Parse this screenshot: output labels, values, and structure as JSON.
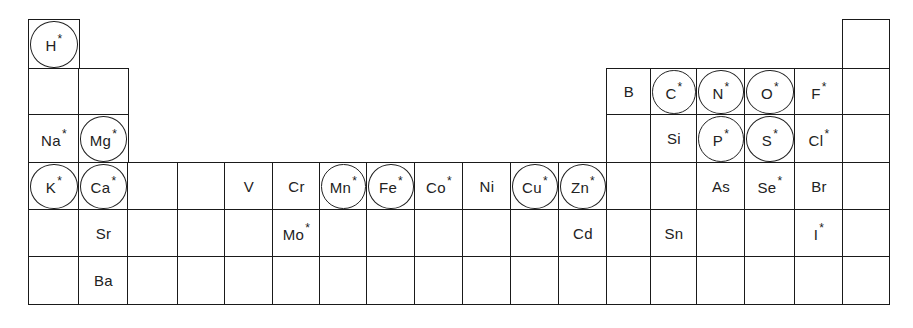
{
  "diagram": {
    "legend": {
      "asterisk": "*",
      "circle": "circled"
    },
    "grid": {
      "columns_x": [
        29,
        79,
        128,
        178,
        225,
        273,
        320,
        367,
        415,
        463,
        511,
        559,
        607,
        651,
        697,
        745,
        795,
        843,
        889
      ],
      "rows_y": [
        20,
        69,
        115,
        163,
        210,
        257,
        304
      ]
    },
    "cells": [
      {
        "row": 0,
        "col": 0,
        "symbol": "H",
        "star": true,
        "circled": true
      },
      {
        "row": 0,
        "col": 17,
        "symbol": "",
        "star": false,
        "circled": false
      },
      {
        "row": 1,
        "col": 0,
        "symbol": "",
        "star": false,
        "circled": false
      },
      {
        "row": 1,
        "col": 1,
        "symbol": "",
        "star": false,
        "circled": false
      },
      {
        "row": 1,
        "col": 12,
        "symbol": "B",
        "star": false,
        "circled": false
      },
      {
        "row": 1,
        "col": 13,
        "symbol": "C",
        "star": true,
        "circled": true
      },
      {
        "row": 1,
        "col": 14,
        "symbol": "N",
        "star": true,
        "circled": true
      },
      {
        "row": 1,
        "col": 15,
        "symbol": "O",
        "star": true,
        "circled": true
      },
      {
        "row": 1,
        "col": 16,
        "symbol": "F",
        "star": true,
        "circled": false
      },
      {
        "row": 1,
        "col": 17,
        "symbol": "",
        "star": false,
        "circled": false
      },
      {
        "row": 2,
        "col": 0,
        "symbol": "Na",
        "star": true,
        "circled": false
      },
      {
        "row": 2,
        "col": 1,
        "symbol": "Mg",
        "star": true,
        "circled": true
      },
      {
        "row": 2,
        "col": 12,
        "symbol": "",
        "star": false,
        "circled": false
      },
      {
        "row": 2,
        "col": 13,
        "symbol": "Si",
        "star": false,
        "circled": false
      },
      {
        "row": 2,
        "col": 14,
        "symbol": "P",
        "star": true,
        "circled": true
      },
      {
        "row": 2,
        "col": 15,
        "symbol": "S",
        "star": true,
        "circled": true
      },
      {
        "row": 2,
        "col": 16,
        "symbol": "Cl",
        "star": true,
        "circled": false
      },
      {
        "row": 2,
        "col": 17,
        "symbol": "",
        "star": false,
        "circled": false
      },
      {
        "row": 3,
        "col": 0,
        "symbol": "K",
        "star": true,
        "circled": true
      },
      {
        "row": 3,
        "col": 1,
        "symbol": "Ca",
        "star": true,
        "circled": true
      },
      {
        "row": 3,
        "col": 2,
        "symbol": "",
        "star": false,
        "circled": false
      },
      {
        "row": 3,
        "col": 3,
        "symbol": "",
        "star": false,
        "circled": false
      },
      {
        "row": 3,
        "col": 4,
        "symbol": "V",
        "star": false,
        "circled": false
      },
      {
        "row": 3,
        "col": 5,
        "symbol": "Cr",
        "star": false,
        "circled": false
      },
      {
        "row": 3,
        "col": 6,
        "symbol": "Mn",
        "star": true,
        "circled": true
      },
      {
        "row": 3,
        "col": 7,
        "symbol": "Fe",
        "star": true,
        "circled": true
      },
      {
        "row": 3,
        "col": 8,
        "symbol": "Co",
        "star": true,
        "circled": false
      },
      {
        "row": 3,
        "col": 9,
        "symbol": "Ni",
        "star": false,
        "circled": false
      },
      {
        "row": 3,
        "col": 10,
        "symbol": "Cu",
        "star": true,
        "circled": true
      },
      {
        "row": 3,
        "col": 11,
        "symbol": "Zn",
        "star": true,
        "circled": true
      },
      {
        "row": 3,
        "col": 12,
        "symbol": "",
        "star": false,
        "circled": false
      },
      {
        "row": 3,
        "col": 13,
        "symbol": "",
        "star": false,
        "circled": false
      },
      {
        "row": 3,
        "col": 14,
        "symbol": "As",
        "star": false,
        "circled": false
      },
      {
        "row": 3,
        "col": 15,
        "symbol": "Se",
        "star": true,
        "circled": false
      },
      {
        "row": 3,
        "col": 16,
        "symbol": "Br",
        "star": false,
        "circled": false
      },
      {
        "row": 3,
        "col": 17,
        "symbol": "",
        "star": false,
        "circled": false
      },
      {
        "row": 4,
        "col": 0,
        "symbol": "",
        "star": false,
        "circled": false
      },
      {
        "row": 4,
        "col": 1,
        "symbol": "Sr",
        "star": false,
        "circled": false
      },
      {
        "row": 4,
        "col": 2,
        "symbol": "",
        "star": false,
        "circled": false
      },
      {
        "row": 4,
        "col": 3,
        "symbol": "",
        "star": false,
        "circled": false
      },
      {
        "row": 4,
        "col": 4,
        "symbol": "",
        "star": false,
        "circled": false
      },
      {
        "row": 4,
        "col": 5,
        "symbol": "Mo",
        "star": true,
        "circled": false
      },
      {
        "row": 4,
        "col": 6,
        "symbol": "",
        "star": false,
        "circled": false
      },
      {
        "row": 4,
        "col": 7,
        "symbol": "",
        "star": false,
        "circled": false
      },
      {
        "row": 4,
        "col": 8,
        "symbol": "",
        "star": false,
        "circled": false
      },
      {
        "row": 4,
        "col": 9,
        "symbol": "",
        "star": false,
        "circled": false
      },
      {
        "row": 4,
        "col": 10,
        "symbol": "",
        "star": false,
        "circled": false
      },
      {
        "row": 4,
        "col": 11,
        "symbol": "Cd",
        "star": false,
        "circled": false
      },
      {
        "row": 4,
        "col": 12,
        "symbol": "",
        "star": false,
        "circled": false
      },
      {
        "row": 4,
        "col": 13,
        "symbol": "Sn",
        "star": false,
        "circled": false
      },
      {
        "row": 4,
        "col": 14,
        "symbol": "",
        "star": false,
        "circled": false
      },
      {
        "row": 4,
        "col": 15,
        "symbol": "",
        "star": false,
        "circled": false
      },
      {
        "row": 4,
        "col": 16,
        "symbol": "I",
        "star": true,
        "circled": false
      },
      {
        "row": 4,
        "col": 17,
        "symbol": "",
        "star": false,
        "circled": false
      },
      {
        "row": 5,
        "col": 0,
        "symbol": "",
        "star": false,
        "circled": false
      },
      {
        "row": 5,
        "col": 1,
        "symbol": "Ba",
        "star": false,
        "circled": false
      },
      {
        "row": 5,
        "col": 2,
        "symbol": "",
        "star": false,
        "circled": false
      },
      {
        "row": 5,
        "col": 3,
        "symbol": "",
        "star": false,
        "circled": false
      },
      {
        "row": 5,
        "col": 4,
        "symbol": "",
        "star": false,
        "circled": false
      },
      {
        "row": 5,
        "col": 5,
        "symbol": "",
        "star": false,
        "circled": false
      },
      {
        "row": 5,
        "col": 6,
        "symbol": "",
        "star": false,
        "circled": false
      },
      {
        "row": 5,
        "col": 7,
        "symbol": "",
        "star": false,
        "circled": false
      },
      {
        "row": 5,
        "col": 8,
        "symbol": "",
        "star": false,
        "circled": false
      },
      {
        "row": 5,
        "col": 9,
        "symbol": "",
        "star": false,
        "circled": false
      },
      {
        "row": 5,
        "col": 10,
        "symbol": "",
        "star": false,
        "circled": false
      },
      {
        "row": 5,
        "col": 11,
        "symbol": "",
        "star": false,
        "circled": false
      },
      {
        "row": 5,
        "col": 12,
        "symbol": "",
        "star": false,
        "circled": false
      },
      {
        "row": 5,
        "col": 13,
        "symbol": "",
        "star": false,
        "circled": false
      },
      {
        "row": 5,
        "col": 14,
        "symbol": "",
        "star": false,
        "circled": false
      },
      {
        "row": 5,
        "col": 15,
        "symbol": "",
        "star": false,
        "circled": false
      },
      {
        "row": 5,
        "col": 16,
        "symbol": "",
        "star": false,
        "circled": false
      },
      {
        "row": 5,
        "col": 17,
        "symbol": "",
        "star": false,
        "circled": false
      }
    ]
  }
}
